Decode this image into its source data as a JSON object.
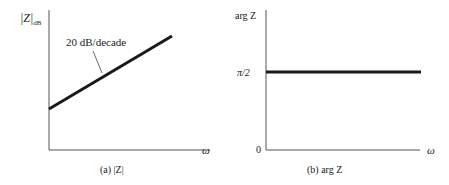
{
  "figure": {
    "panel_a": {
      "caption": "(a) |Z|",
      "y_axis_label": "|Z|",
      "y_axis_subscript": "dB",
      "x_axis_label": "ω",
      "annotation": "20 dB/decade"
    },
    "panel_b": {
      "caption": "(b) arg Z",
      "y_axis_label": "arg Z",
      "y_tick_pi2": "π/2",
      "y_tick_zero": "0",
      "x_axis_label": "ω"
    },
    "colors": {
      "line": "#1a1a1a",
      "axis": "#555555",
      "text": "#222222"
    }
  }
}
